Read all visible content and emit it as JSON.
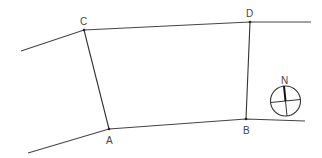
{
  "diagram": {
    "type": "quadrilateral-between-roads",
    "points": {
      "A": {
        "label": "A",
        "x": 109,
        "y": 129,
        "label_x": 106,
        "label_y": 144
      },
      "B": {
        "label": "B",
        "x": 246,
        "y": 119,
        "label_x": 243,
        "label_y": 134
      },
      "C": {
        "label": "C",
        "x": 84,
        "y": 30,
        "label_x": 80,
        "label_y": 25
      },
      "D": {
        "label": "D",
        "x": 250,
        "y": 22,
        "label_x": 246,
        "label_y": 17
      }
    },
    "upper_road": [
      [
        21,
        51
      ],
      [
        84,
        30
      ],
      [
        250,
        22
      ],
      [
        311,
        22
      ]
    ],
    "lower_road": [
      [
        28,
        153
      ],
      [
        109,
        129
      ],
      [
        246,
        119
      ],
      [
        305,
        121
      ]
    ],
    "sides": [
      {
        "from": "C",
        "to": "A"
      },
      {
        "from": "D",
        "to": "B"
      }
    ],
    "compass": {
      "label": "N",
      "cx": 285.5,
      "cy": 101,
      "r": 15,
      "label_x": 281,
      "label_y": 83
    },
    "colors": {
      "line": "#444444",
      "background": "#ffffff"
    }
  }
}
